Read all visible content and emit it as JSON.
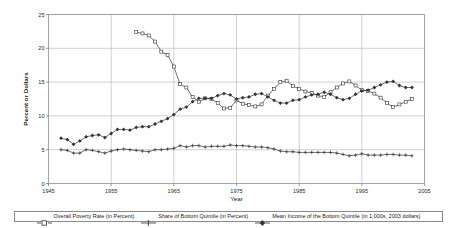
{
  "chart_data": {
    "type": "line",
    "title": "",
    "xlabel": "Year",
    "ylabel": "Percent or Dollars",
    "xlim": [
      1945,
      2005
    ],
    "ylim": [
      0,
      25
    ],
    "xticks": [
      "1945",
      "1955",
      "1965",
      "1975",
      "1985",
      "1995",
      "2005"
    ],
    "yticks": [
      "0",
      "5",
      "10",
      "15",
      "20",
      "25"
    ],
    "grid": true,
    "legend_position": "bottom",
    "series": [
      {
        "name": "Overall Poverty Rate (in Percent)",
        "marker": "open-square",
        "color": "#333333",
        "x": [
          1959,
          1960,
          1961,
          1962,
          1963,
          1964,
          1965,
          1966,
          1967,
          1968,
          1969,
          1970,
          1971,
          1972,
          1973,
          1974,
          1975,
          1976,
          1977,
          1978,
          1979,
          1980,
          1981,
          1982,
          1983,
          1984,
          1985,
          1986,
          1987,
          1988,
          1989,
          1990,
          1991,
          1992,
          1993,
          1994,
          1995,
          1996,
          1997,
          1998,
          1999,
          2000,
          2001,
          2002,
          2003
        ],
        "values": [
          22.4,
          22.2,
          21.9,
          21.0,
          19.5,
          19.0,
          17.3,
          14.7,
          14.2,
          12.8,
          12.1,
          12.6,
          12.5,
          11.9,
          11.1,
          11.2,
          12.3,
          11.8,
          11.6,
          11.4,
          11.7,
          13.0,
          14.0,
          15.0,
          15.2,
          14.4,
          14.0,
          13.6,
          13.4,
          13.0,
          12.8,
          13.5,
          14.2,
          14.8,
          15.1,
          14.5,
          13.8,
          13.7,
          13.3,
          12.7,
          11.9,
          11.3,
          11.7,
          12.1,
          12.5
        ]
      },
      {
        "name": "Share of Bottom Quintile (in Percent)",
        "marker": "plus",
        "color": "#333333",
        "x": [
          1947,
          1948,
          1949,
          1950,
          1951,
          1952,
          1953,
          1954,
          1955,
          1956,
          1957,
          1958,
          1959,
          1960,
          1961,
          1962,
          1963,
          1964,
          1965,
          1966,
          1967,
          1968,
          1969,
          1970,
          1971,
          1972,
          1973,
          1974,
          1975,
          1976,
          1977,
          1978,
          1979,
          1980,
          1981,
          1982,
          1983,
          1984,
          1985,
          1986,
          1987,
          1988,
          1989,
          1990,
          1991,
          1992,
          1993,
          1994,
          1995,
          1996,
          1997,
          1998,
          1999,
          2000,
          2001,
          2002,
          2003
        ],
        "values": [
          5.0,
          4.9,
          4.5,
          4.5,
          5.0,
          4.9,
          4.7,
          4.5,
          4.8,
          5.0,
          5.1,
          5.0,
          4.9,
          4.8,
          4.7,
          5.0,
          5.0,
          5.1,
          5.2,
          5.6,
          5.4,
          5.6,
          5.6,
          5.4,
          5.5,
          5.5,
          5.5,
          5.7,
          5.6,
          5.6,
          5.5,
          5.4,
          5.4,
          5.3,
          5.1,
          4.8,
          4.7,
          4.7,
          4.6,
          4.6,
          4.6,
          4.6,
          4.6,
          4.6,
          4.5,
          4.3,
          4.1,
          4.2,
          4.4,
          4.2,
          4.2,
          4.2,
          4.3,
          4.3,
          4.2,
          4.2,
          4.1
        ]
      },
      {
        "name": "Mean Income of the Bottom Quintile (in 1,000s, 2003 dollars)",
        "marker": "filled-diamond",
        "color": "#333333",
        "x": [
          1947,
          1948,
          1949,
          1950,
          1951,
          1952,
          1953,
          1954,
          1955,
          1956,
          1957,
          1958,
          1959,
          1960,
          1961,
          1962,
          1963,
          1964,
          1965,
          1966,
          1967,
          1968,
          1969,
          1970,
          1971,
          1972,
          1973,
          1974,
          1975,
          1976,
          1977,
          1978,
          1979,
          1980,
          1981,
          1982,
          1983,
          1984,
          1985,
          1986,
          1987,
          1988,
          1989,
          1990,
          1991,
          1992,
          1993,
          1994,
          1995,
          1996,
          1997,
          1998,
          1999,
          2000,
          2001,
          2002,
          2003
        ],
        "values": [
          6.7,
          6.5,
          5.8,
          6.3,
          6.9,
          7.1,
          7.2,
          6.8,
          7.4,
          8.0,
          8.0,
          7.9,
          8.3,
          8.4,
          8.4,
          8.8,
          9.2,
          9.6,
          10.2,
          11.0,
          11.3,
          12.1,
          12.6,
          12.6,
          12.6,
          13.0,
          13.3,
          13.1,
          12.5,
          12.7,
          12.8,
          13.2,
          13.3,
          12.8,
          12.3,
          11.9,
          11.9,
          12.3,
          12.4,
          12.8,
          13.1,
          13.2,
          13.5,
          13.2,
          12.7,
          12.4,
          12.6,
          13.2,
          13.7,
          13.8,
          14.2,
          14.6,
          15.0,
          15.1,
          14.5,
          14.2,
          14.2
        ]
      }
    ]
  },
  "axes": {
    "y_title": "Percent or Dollars",
    "x_title": "Year"
  },
  "legend": {
    "items": [
      {
        "label": "Overall Poverty Rate (in Percent)",
        "marker": "open-square"
      },
      {
        "label": "Share of  Bottom Quintile (in Percent)",
        "marker": "plus"
      },
      {
        "label": "Mean Income of the Bottom Quintile (in 1,000s, 2003 dollars)",
        "marker": "filled-diamond"
      }
    ]
  }
}
